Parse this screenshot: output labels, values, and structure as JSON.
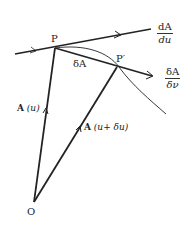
{
  "diagram": {
    "points": {
      "P": {
        "label": "P",
        "x": 55,
        "y": 48
      },
      "P_prime": {
        "label": "P′",
        "x": 117,
        "y": 67
      },
      "O": {
        "label": "O",
        "x": 34,
        "y": 202
      }
    },
    "labels": {
      "delta_A": "δA",
      "A_u": "A (u)",
      "A_u_bold": "A",
      "A_u_arg": "(u)",
      "A_u_du_bold": "A",
      "A_u_du_arg": "(u+ δu)",
      "tangent_num": "dA",
      "tangent_den": "du",
      "chord_num": "δA",
      "chord_den": "δν"
    },
    "colors": {
      "line": "#222222",
      "background": "#ffffff"
    }
  }
}
